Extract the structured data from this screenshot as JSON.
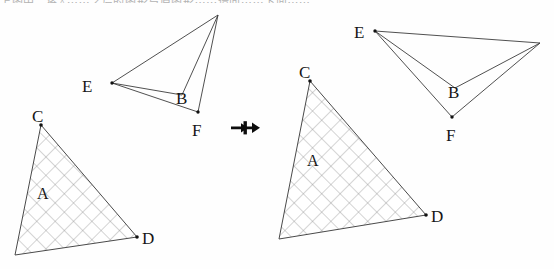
{
  "page": {
    "width": 554,
    "height": 269,
    "background_color": "#fefefe",
    "top_cropped_text": "上图中，将△⋯⋯之后的图形与原图形⋯⋯请问⋯⋯下面⋯⋯"
  },
  "left_figure": {
    "name": "original-figure",
    "dart": {
      "label_E": "E",
      "label_B": "B",
      "label_F": "F",
      "points": {
        "E": [
          112,
          83
        ],
        "B": [
          182,
          95
        ],
        "F": [
          198,
          112
        ],
        "apex": [
          218,
          15
        ]
      },
      "label_positions": {
        "E": [
          88,
          90
        ],
        "B": [
          183,
          101
        ],
        "F": [
          197,
          131
        ]
      },
      "marked_vertices": [
        "E",
        "F"
      ]
    },
    "triangle": {
      "label_C": "C",
      "label_D": "D",
      "label_A": "A",
      "points": {
        "C": [
          41,
          125
        ],
        "D": [
          137,
          237
        ],
        "bottom_left": [
          15,
          255
        ]
      },
      "label_positions": {
        "C": [
          36,
          120
        ],
        "D": [
          143,
          243
        ],
        "A": [
          42,
          196
        ]
      },
      "marked_vertices": [
        "C",
        "D"
      ],
      "fill": "cross-hatched"
    }
  },
  "transform_arrow": {
    "glyph_name": "double-right-arrow",
    "position": [
      248,
      127
    ],
    "color": "#0d0d0d"
  },
  "right_figure": {
    "name": "transformed-figure",
    "dart": {
      "label_E": "E",
      "label_B": "B",
      "label_F": "F",
      "points": {
        "E": [
          375,
          31
        ],
        "B": [
          455,
          88
        ],
        "F": [
          452,
          117
        ],
        "apex": [
          540,
          43
        ]
      },
      "label_positions": {
        "E": [
          360,
          36
        ],
        "B": [
          456,
          95
        ],
        "F": [
          453,
          136
        ]
      },
      "marked_vertices": [
        "E",
        "F"
      ]
    },
    "triangle": {
      "label_C": "C",
      "label_D": "D",
      "label_A": "A",
      "points": {
        "C": [
          310,
          81
        ],
        "D": [
          426,
          215
        ],
        "bottom_left": [
          279,
          239
        ]
      },
      "label_positions": {
        "C": [
          302,
          76
        ],
        "D": [
          432,
          221
        ],
        "A": [
          312,
          163
        ]
      },
      "marked_vertices": [
        "C",
        "D"
      ],
      "fill": "cross-hatched"
    }
  },
  "colors": {
    "stroke": "#3c3c3c",
    "hatch": "#8e8e8e",
    "label": "#161616",
    "dot": "#111111"
  }
}
